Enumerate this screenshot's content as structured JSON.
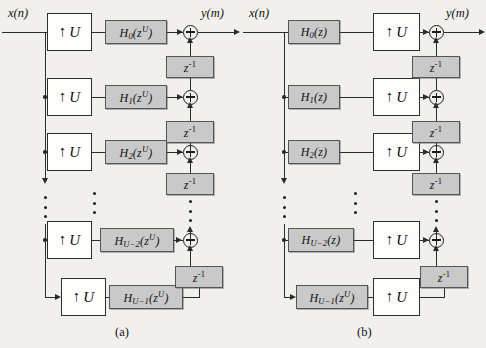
{
  "figure": {
    "background_color": "#f2f0ec",
    "line_color": "#2b2b2b",
    "filter_fill": "#c9c9c9",
    "upsampler_fill": "#fdfdfb"
  },
  "panels": [
    {
      "id": "a",
      "caption": "(a)",
      "input_label": "x(n)",
      "output_label": "y(m)",
      "order": "upsampler-then-filter",
      "rows": [
        {
          "upsampler": "U",
          "filter_base": "H",
          "filter_index": "0",
          "filter_arg": "z",
          "filter_arg_exp": "U"
        },
        {
          "upsampler": "U",
          "filter_base": "H",
          "filter_index": "1",
          "filter_arg": "z",
          "filter_arg_exp": "U"
        },
        {
          "upsampler": "U",
          "filter_base": "H",
          "filter_index": "2",
          "filter_arg": "z",
          "filter_arg_exp": "U"
        },
        {
          "upsampler": "U",
          "filter_base": "H",
          "filter_index": "U−2",
          "filter_arg": "z",
          "filter_arg_exp": "U"
        },
        {
          "upsampler": "U",
          "filter_base": "H",
          "filter_index": "U−1",
          "filter_arg": "z",
          "filter_arg_exp": "U"
        }
      ],
      "delay_label_base": "z",
      "delay_label_exp": "-1",
      "delay_count": 4,
      "adder_count": 5,
      "upsampler_symbol": "↑"
    },
    {
      "id": "b",
      "caption": "(b)",
      "input_label": "x(n)",
      "output_label": "y(m)",
      "order": "filter-then-upsampler",
      "rows": [
        {
          "upsampler": "U",
          "filter_base": "H",
          "filter_index": "0",
          "filter_arg": "z",
          "filter_arg_exp": ""
        },
        {
          "upsampler": "U",
          "filter_base": "H",
          "filter_index": "1",
          "filter_arg": "z",
          "filter_arg_exp": ""
        },
        {
          "upsampler": "U",
          "filter_base": "H",
          "filter_index": "2",
          "filter_arg": "z",
          "filter_arg_exp": ""
        },
        {
          "upsampler": "U",
          "filter_base": "H",
          "filter_index": "U−2",
          "filter_arg": "z",
          "filter_arg_exp": ""
        },
        {
          "upsampler": "U",
          "filter_base": "H",
          "filter_index": "U−1",
          "filter_arg": "z",
          "filter_arg_exp": "U"
        }
      ],
      "delay_label_base": "z",
      "delay_label_exp": "-1",
      "delay_count": 4,
      "adder_count": 5,
      "upsampler_symbol": "↑"
    }
  ]
}
